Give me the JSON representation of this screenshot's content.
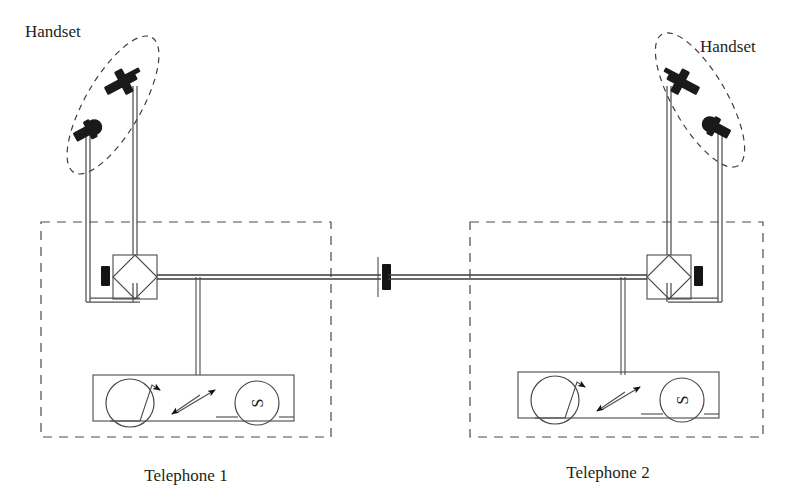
{
  "figure": {
    "background_color": "#ffffff",
    "line_color": "#4a4a4a",
    "ink_color": "#1a1a1a"
  },
  "labels": {
    "handset_left": "Handset",
    "handset_right": "Handset",
    "telephone_left": "Telephone 1",
    "telephone_right": "Telephone 2",
    "sounder_left": "S",
    "sounder_right": "S"
  },
  "components": {
    "left_station": {
      "enclosure_name": "Telephone 1 enclosure",
      "handset_group": "handset-left",
      "hybrid": "hybrid-coupler-left",
      "line_terminal": "line-terminal-left",
      "sounder": "S",
      "coil": "induction-coil-left",
      "contact": "switch-contact-left"
    },
    "right_station": {
      "enclosure_name": "Telephone 2 enclosure",
      "handset_group": "handset-right",
      "hybrid": "hybrid-coupler-right",
      "line_terminal": "line-terminal-right",
      "sounder": "S",
      "coil": "induction-coil-right",
      "contact": "switch-contact-right"
    },
    "line": {
      "name": "interconnecting-line",
      "midpoint_marker": "line-break-marker"
    }
  },
  "icons": {
    "earpiece": "earpiece-icon",
    "mouthpiece": "mouthpiece-icon",
    "hybrid_diamond": "diamond-coupler-icon",
    "terminal_block": "terminal-block-icon",
    "sounder_circle": "sounder-icon",
    "coil_circle": "coil-icon"
  }
}
